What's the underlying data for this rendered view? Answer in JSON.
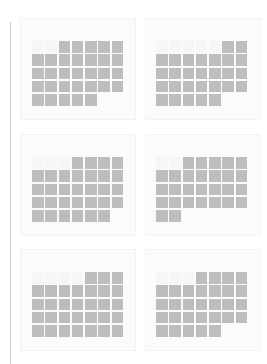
{
  "layout": {
    "columns": 2,
    "rows": 3,
    "weekday_columns": 7
  },
  "colors": {
    "day_cell": "#bdbdbd",
    "empty_cell": "#f6f6f6",
    "card_background": "#fbfbfb",
    "rule": "#cfcfcf"
  },
  "months": [
    {
      "title": "",
      "leading_blanks": 2,
      "days": 31
    },
    {
      "title": "",
      "leading_blanks": 5,
      "days": 28
    },
    {
      "title": "",
      "leading_blanks": 3,
      "days": 31
    },
    {
      "title": "",
      "leading_blanks": 2,
      "days": 28
    },
    {
      "title": "",
      "leading_blanks": 4,
      "days": 31
    },
    {
      "title": "",
      "leading_blanks": 3,
      "days": 30
    }
  ]
}
